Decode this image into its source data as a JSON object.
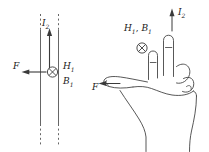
{
  "figure": {
    "stroke_color": "#3a3a3a",
    "line_color": "#555555",
    "text_color": "#1a1a1a"
  },
  "wire_diagram": {
    "name": "current-carrying-wire-diagram",
    "current_label": "I",
    "current_sub": "2",
    "force_label": "F",
    "field_h_label": "H",
    "field_h_sub": "1",
    "field_b_label": "B",
    "field_b_sub": "1",
    "into_page_symbol": "cross-in-circle",
    "current_direction": "up",
    "force_direction": "left",
    "field_direction": "into-page"
  },
  "hand_diagram": {
    "name": "hand-rule-illustration",
    "current_label": "I",
    "current_sub": "2",
    "field_label_h": "H",
    "field_label_h_sub": "1",
    "field_label_b": "B",
    "field_label_b_sub": "1",
    "field_separator": ", ",
    "force_label": "F",
    "into_page_symbol": "cross-in-circle",
    "index_finger_direction": "up",
    "middle_finger_direction": "into-page",
    "thumb_direction": "left"
  }
}
